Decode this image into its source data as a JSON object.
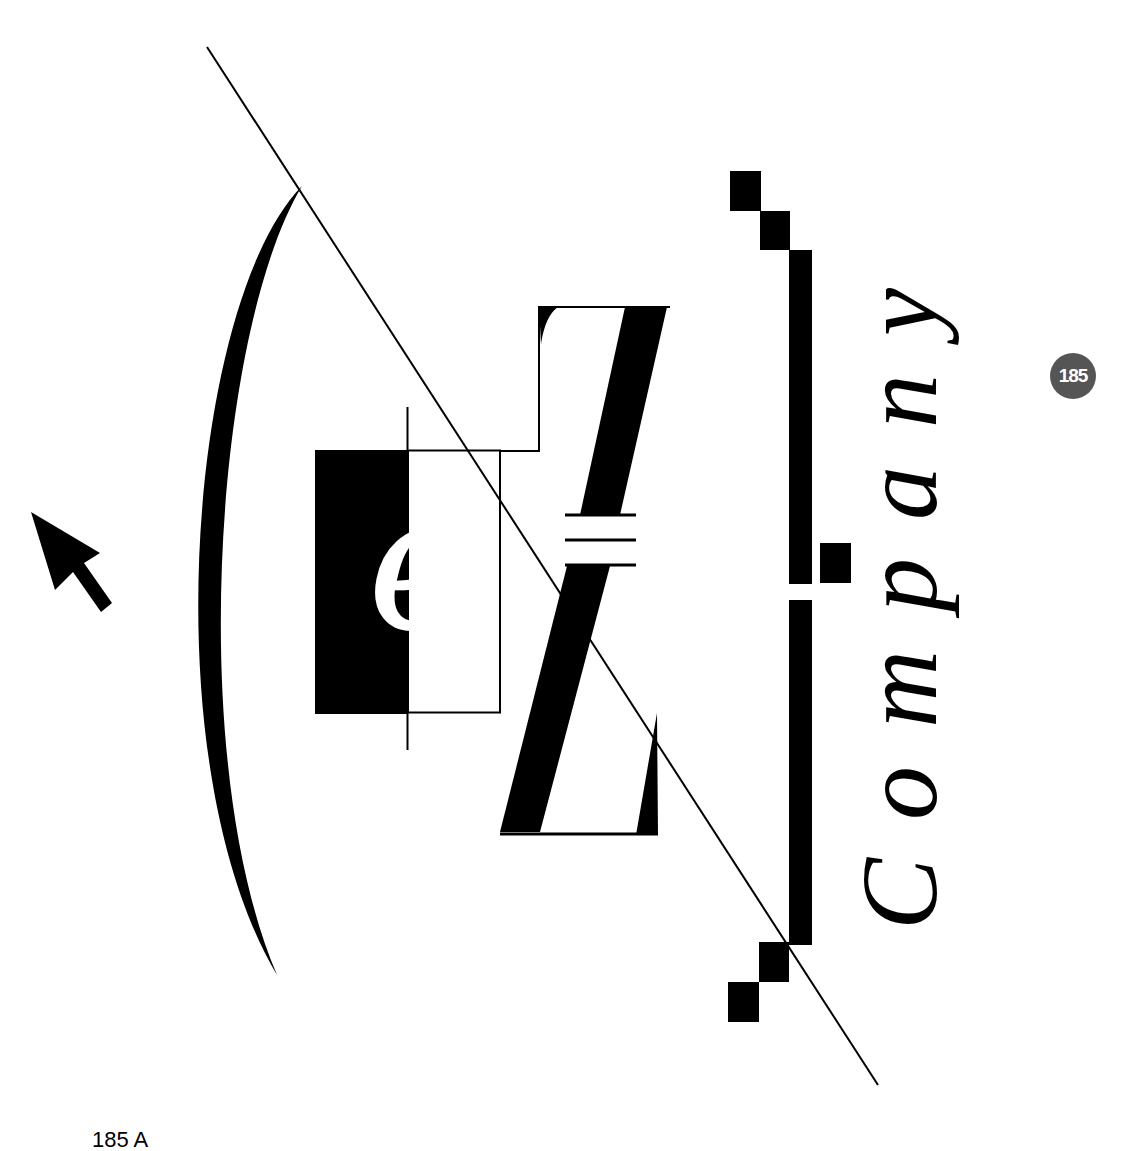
{
  "logo": {
    "monogram_letter": "e",
    "wordmark": "Company",
    "colors": {
      "ink": "#000000",
      "paper": "#ffffff",
      "badge": "#555555"
    }
  },
  "badge": {
    "number": "185"
  },
  "caption": {
    "text": "185 A"
  },
  "icons": {
    "pointer": "arrow-cursor-icon"
  }
}
